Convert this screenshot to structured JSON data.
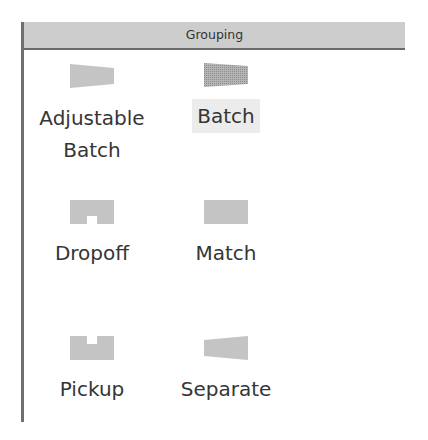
{
  "panel": {
    "header": {
      "title": "Grouping"
    },
    "items": [
      {
        "label_line1": "Adjustable",
        "label_line2": "Batch",
        "icon": "adjustable-batch-icon",
        "selected": false
      },
      {
        "label_line1": "Batch",
        "label_line2": "",
        "icon": "batch-icon",
        "selected": true
      },
      {
        "label_line1": "Dropoff",
        "label_line2": "",
        "icon": "dropoff-icon",
        "selected": false
      },
      {
        "label_line1": "Match",
        "label_line2": "",
        "icon": "match-icon",
        "selected": false
      },
      {
        "label_line1": "Pickup",
        "label_line2": "",
        "icon": "pickup-icon",
        "selected": false
      },
      {
        "label_line1": "Separate",
        "label_line2": "",
        "icon": "separate-icon",
        "selected": false
      }
    ],
    "colors": {
      "header_bg": "#cdcdcd",
      "border": "#6a6a6a",
      "icon_fill": "#c4c4c4",
      "batch_icon_fill": "#a8a8a8",
      "selection_bg": "#ececec",
      "text": "#353535"
    }
  }
}
